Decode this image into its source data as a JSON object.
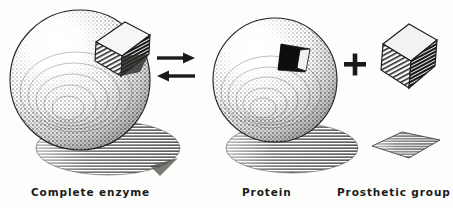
{
  "figure": {
    "background_color": "#fdfdfb",
    "ink_color": "#1a1a1a",
    "style": "stipple engraving"
  },
  "labels": {
    "complete_enzyme": "Complete enzyme",
    "protein": "Protein",
    "prosthetic_group": "Prosthetic group"
  },
  "symbols": {
    "plus": "+",
    "arrow_forward": "→",
    "arrow_reverse": "←"
  },
  "elements": {
    "sphere_left": {
      "name": "complete-enzyme-sphere",
      "cx": 80,
      "cy": 80,
      "r": 70,
      "highlight": "upper-left",
      "has_embedded_block": true
    },
    "block_left": {
      "name": "embedded-prosthetic-block",
      "cx": 120,
      "cy": 45,
      "faces": {
        "top": "#f4f4f2",
        "left": "#8e8e8c",
        "right": "#3a3a38"
      }
    },
    "sphere_right": {
      "name": "protein-sphere",
      "cx": 275,
      "cy": 80,
      "r": 62,
      "highlight": "upper-left",
      "has_cavity": true,
      "cavity_color": "#141414"
    },
    "block_free": {
      "name": "free-prosthetic-block",
      "cx": 406,
      "cy": 58,
      "faces": {
        "top": "#efefed",
        "left": "#8a8a88",
        "right": "#2e2e2c"
      }
    },
    "shadow_left": {
      "name": "left-sphere-shadow",
      "cx": 108,
      "cy": 148,
      "rx": 72,
      "ry": 27
    },
    "shadow_right": {
      "name": "right-sphere-shadow",
      "cx": 292,
      "cy": 148,
      "rx": 66,
      "ry": 25
    },
    "shadow_block": {
      "name": "block-shadow",
      "cx": 405,
      "cy": 146
    }
  },
  "colors": {
    "ink": "#1a1a1a",
    "shadow_gray": "#7a7a78",
    "sphere_mid": "#9a9a96",
    "paper": "#fdfdfb"
  }
}
